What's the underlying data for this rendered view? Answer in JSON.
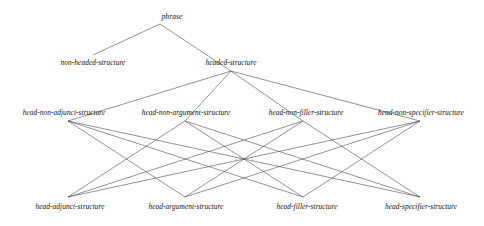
{
  "diagram": {
    "kind": "type-hierarchy-lattice",
    "stroke_color": "#4a4a4a",
    "text_color": "#111111",
    "background_color": "#ffffff",
    "nodes": [
      {
        "id": "phrase",
        "label": "phrase",
        "level": 0,
        "x": 172,
        "y": 16,
        "anchor_x": 160,
        "anchor_y": 24
      },
      {
        "id": "non-headed-structure",
        "label": "non-headed-structure",
        "level": 1,
        "x": 93,
        "y": 62,
        "anchor_x": 93,
        "anchor_y": 55
      },
      {
        "id": "headed-structure",
        "label": "headed-structure",
        "level": 1,
        "x": 231,
        "y": 62,
        "anchor_x": 231,
        "anchor_y": 71
      },
      {
        "id": "head-non-adjunct-structure",
        "label": "head-non-adjunct-structure",
        "level": 2,
        "x": 64,
        "y": 112,
        "anchor_x": 68,
        "anchor_y": 121
      },
      {
        "id": "head-non-argument-structure",
        "label": "head-non-argument-structure",
        "level": 2,
        "x": 186,
        "y": 112,
        "anchor_x": 185,
        "anchor_y": 121
      },
      {
        "id": "head-non-filler-structure",
        "label": "head-non-filler-structure",
        "level": 2,
        "x": 306,
        "y": 112,
        "anchor_x": 303,
        "anchor_y": 121
      },
      {
        "id": "head-non-specifier-structure",
        "label": "head-non-specifier-structure",
        "level": 2,
        "x": 421,
        "y": 112,
        "anchor_x": 420,
        "anchor_y": 121
      },
      {
        "id": "head-adjunct-structure",
        "label": "head-adjunct-structure",
        "level": 3,
        "x": 70,
        "y": 206,
        "anchor_x": 68,
        "anchor_y": 197
      },
      {
        "id": "head-argument-structure",
        "label": "head-argument-structure",
        "level": 3,
        "x": 186,
        "y": 206,
        "anchor_x": 185,
        "anchor_y": 197
      },
      {
        "id": "head-filler-structure",
        "label": "head-filler-structure",
        "level": 3,
        "x": 307,
        "y": 206,
        "anchor_x": 303,
        "anchor_y": 197
      },
      {
        "id": "head-specifier-structure",
        "label": "head-specifier-structure",
        "level": 3,
        "x": 421,
        "y": 206,
        "anchor_x": 420,
        "anchor_y": 197
      }
    ],
    "edges": [
      {
        "from": "phrase",
        "to": "non-headed-structure"
      },
      {
        "from": "phrase",
        "to": "headed-structure"
      },
      {
        "from": "headed-structure",
        "to": "head-non-adjunct-structure"
      },
      {
        "from": "headed-structure",
        "to": "head-non-argument-structure"
      },
      {
        "from": "headed-structure",
        "to": "head-non-filler-structure"
      },
      {
        "from": "headed-structure",
        "to": "head-non-specifier-structure"
      },
      {
        "from": "head-non-adjunct-structure",
        "to": "head-argument-structure"
      },
      {
        "from": "head-non-adjunct-structure",
        "to": "head-filler-structure"
      },
      {
        "from": "head-non-adjunct-structure",
        "to": "head-specifier-structure"
      },
      {
        "from": "head-non-argument-structure",
        "to": "head-adjunct-structure"
      },
      {
        "from": "head-non-argument-structure",
        "to": "head-filler-structure"
      },
      {
        "from": "head-non-argument-structure",
        "to": "head-specifier-structure"
      },
      {
        "from": "head-non-filler-structure",
        "to": "head-adjunct-structure"
      },
      {
        "from": "head-non-filler-structure",
        "to": "head-argument-structure"
      },
      {
        "from": "head-non-filler-structure",
        "to": "head-specifier-structure"
      },
      {
        "from": "head-non-specifier-structure",
        "to": "head-adjunct-structure"
      },
      {
        "from": "head-non-specifier-structure",
        "to": "head-argument-structure"
      },
      {
        "from": "head-non-specifier-structure",
        "to": "head-filler-structure"
      }
    ]
  }
}
